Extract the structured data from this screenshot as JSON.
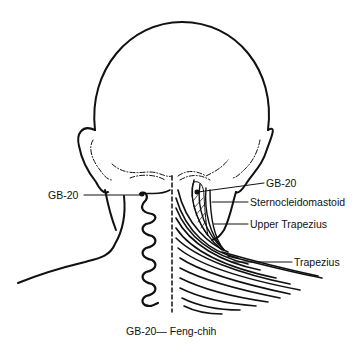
{
  "diagram": {
    "labels": {
      "gb20_left": "GB-20",
      "gb20_right": "GB-20",
      "sternocleidomastoid": "Sternocleidomastoid",
      "upper_trapezius": "Upper Trapezius",
      "trapezius": "Trapezius"
    },
    "caption": "GB-20— Feng-chih",
    "colors": {
      "ink": "#111111",
      "background": "#ffffff"
    }
  }
}
